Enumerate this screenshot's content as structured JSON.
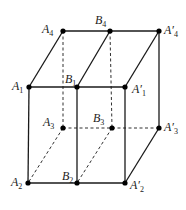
{
  "diagram": {
    "type": "geometry-figure",
    "line_color": "#1a1a1a",
    "points": [
      {
        "id": "A4",
        "label": "A",
        "sub": "4",
        "x": 63,
        "y": 31,
        "lx": 42,
        "ly": 33
      },
      {
        "id": "B4",
        "label": "B",
        "sub": "4",
        "x": 110,
        "y": 31,
        "lx": 95,
        "ly": 24
      },
      {
        "id": "A4p",
        "label": "A′",
        "sub": "4",
        "x": 159,
        "y": 31,
        "lx": 164,
        "ly": 34
      },
      {
        "id": "A1",
        "label": "A",
        "sub": "1",
        "x": 29,
        "y": 87,
        "lx": 12,
        "ly": 90
      },
      {
        "id": "B1",
        "label": "B",
        "sub": "1",
        "x": 77,
        "y": 87,
        "lx": 65,
        "ly": 83
      },
      {
        "id": "A1p",
        "label": "A′",
        "sub": "1",
        "x": 125,
        "y": 87,
        "lx": 132,
        "ly": 93
      },
      {
        "id": "A3",
        "label": "A",
        "sub": "3",
        "x": 63,
        "y": 128,
        "lx": 43,
        "ly": 126
      },
      {
        "id": "B3",
        "label": "B",
        "sub": "3",
        "x": 112,
        "y": 128,
        "lx": 93,
        "ly": 122
      },
      {
        "id": "A3p",
        "label": "A′",
        "sub": "3",
        "x": 159,
        "y": 128,
        "lx": 164,
        "ly": 131
      },
      {
        "id": "A2",
        "label": "A",
        "sub": "2",
        "x": 28,
        "y": 183,
        "lx": 11,
        "ly": 186
      },
      {
        "id": "B2",
        "label": "B",
        "sub": "2",
        "x": 77,
        "y": 183,
        "lx": 62,
        "ly": 180
      },
      {
        "id": "A2p",
        "label": "A′",
        "sub": "2",
        "x": 125,
        "y": 183,
        "lx": 130,
        "ly": 189
      }
    ],
    "solid_edges": [
      [
        "A4",
        "B4"
      ],
      [
        "B4",
        "A4p"
      ],
      [
        "A1",
        "B1"
      ],
      [
        "B1",
        "A1p"
      ],
      [
        "A4",
        "A1"
      ],
      [
        "B4",
        "B1"
      ],
      [
        "A4p",
        "A1p"
      ],
      [
        "A1",
        "A2"
      ],
      [
        "B1",
        "B2"
      ],
      [
        "A1p",
        "A2p"
      ],
      [
        "A4p",
        "A3p"
      ],
      [
        "A2",
        "B2"
      ],
      [
        "B2",
        "A2p"
      ],
      [
        "A3p",
        "A2p"
      ]
    ],
    "dashed_edges": [
      [
        "A4",
        "A3"
      ],
      [
        "B4",
        "B3"
      ],
      [
        "A3",
        "B3"
      ],
      [
        "B3",
        "A3p"
      ],
      [
        "A3",
        "A2"
      ],
      [
        "B3",
        "B2"
      ]
    ]
  }
}
